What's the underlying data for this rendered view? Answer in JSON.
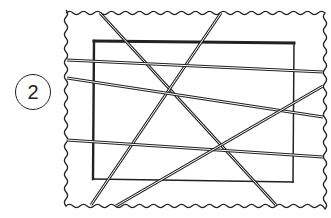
{
  "figure": {
    "label": "2",
    "colors": {
      "ink": "#222222",
      "background": "#ffffff"
    },
    "frame": {
      "type": "wavy-border",
      "left": 66,
      "top": 13,
      "right": 325,
      "bottom": 206
    },
    "rectangle": {
      "x1": 94,
      "y1": 41,
      "x2": 294,
      "y2": 180
    },
    "lines": [
      {
        "id": 1,
        "from": [
          100,
          13
        ],
        "to": [
          276,
          205
        ]
      },
      {
        "id": 2,
        "from": [
          221,
          13
        ],
        "to": [
          91,
          205
        ]
      },
      {
        "id": 3,
        "from": [
          67,
          60
        ],
        "to": [
          323,
          72
        ]
      },
      {
        "id": 4,
        "from": [
          67,
          78
        ],
        "to": [
          323,
          117
        ]
      },
      {
        "id": 5,
        "from": [
          67,
          140
        ],
        "to": [
          323,
          157
        ]
      },
      {
        "id": 6,
        "from": [
          116,
          206
        ],
        "to": [
          323,
          86
        ]
      }
    ]
  }
}
